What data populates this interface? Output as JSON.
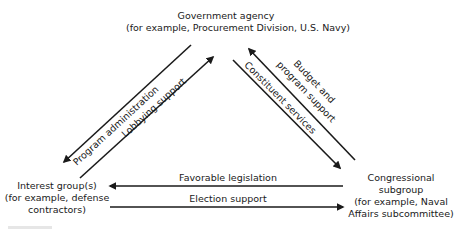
{
  "nodes": {
    "agency": {
      "title": "Government agency",
      "example": "(for example, Procurement Division, U.S. Navy)"
    },
    "interest": {
      "line1": "Interest group(s)",
      "line2": "(for example, defense",
      "line3": "contractors)"
    },
    "congress": {
      "line1": "Congressional",
      "line2": "subgroup",
      "line3": "(for example, Naval",
      "line4": "Affairs subcommittee)"
    }
  },
  "edges": {
    "program_administration": "Program administration",
    "lobbying_support": "Lobbying support",
    "budget_line1": "Budget and",
    "budget_line2": "program support",
    "constituent_services": "Constituent services",
    "favorable_legislation": "Favorable legislation",
    "election_support": "Election support"
  },
  "colors": {
    "ink": "#1a1a1a",
    "background": "#ffffff"
  }
}
